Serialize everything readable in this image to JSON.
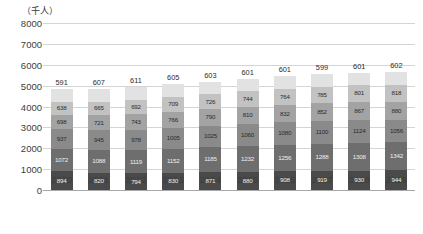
{
  "unit_label": "（千人）",
  "chart_data": {
    "type": "bar",
    "subtype": "stacked-bar",
    "title": "",
    "subtitle": "",
    "xlabel": "",
    "ylabel": "（千人）",
    "ylim": [
      0,
      8000
    ],
    "ytick_values": [
      0,
      1000,
      2000,
      3000,
      4000,
      5000,
      6000,
      7000,
      8000
    ],
    "ytick_labels": [
      "0",
      "1000",
      "2000",
      "3000",
      "4000",
      "5000",
      "6000",
      "7000",
      "8000"
    ],
    "grid": true,
    "legend": "none",
    "categories": [
      "2010",
      "2011",
      "2012",
      "2013",
      "2014",
      "2015",
      "2016",
      "2017",
      "2018",
      "2019"
    ],
    "series": [
      {
        "name": "segment-1-bottom",
        "color": "#4a4a4a",
        "values": [
          894,
          820,
          794,
          830,
          871,
          880,
          908,
          919,
          930,
          944
        ]
      },
      {
        "name": "segment-2",
        "color": "#6e6e6e",
        "values": [
          1072,
          1088,
          1119,
          1152,
          1185,
          1232,
          1256,
          1288,
          1308,
          1342
        ]
      },
      {
        "name": "segment-3",
        "color": "#8a8a8a",
        "values": [
          937,
          945,
          978,
          1005,
          1025,
          1060,
          1080,
          1100,
          1124,
          1056
        ]
      },
      {
        "name": "segment-4",
        "color": "#a3a3a3",
        "values": [
          698,
          721,
          743,
          766,
          790,
          810,
          832,
          852,
          867,
          880
        ]
      },
      {
        "name": "segment-5",
        "color": "#c2c2c2",
        "values": [
          638,
          665,
          692,
          709,
          726,
          744,
          764,
          785,
          801,
          818
        ]
      },
      {
        "name": "segment-6-top",
        "color": "#e2e2e2",
        "values": [
          591,
          607,
          611,
          605,
          603,
          601,
          601,
          599,
          601,
          602
        ]
      }
    ],
    "totals": [
      4830,
      4846,
      4937,
      5067,
      5200,
      5327,
      5441,
      5543,
      5631,
      5642
    ]
  }
}
